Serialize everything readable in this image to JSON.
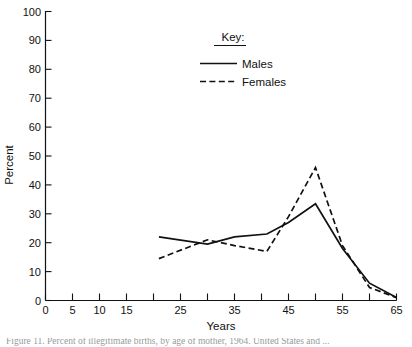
{
  "chart_data": {
    "type": "line",
    "title": "",
    "xlabel": "Years",
    "ylabel": "Percent",
    "xlim": [
      0,
      65
    ],
    "ylim": [
      0,
      100
    ],
    "grid": false,
    "legend_position": "top-center",
    "legend_title": "Key:",
    "x_ticks": [
      0,
      5,
      10,
      15,
      20,
      25,
      30,
      35,
      40,
      45,
      50,
      55,
      60,
      65
    ],
    "x_tick_labels": [
      "0",
      "5",
      "10",
      "15",
      "",
      "25",
      "",
      "35",
      "",
      "45",
      "",
      "55",
      "",
      "65"
    ],
    "y_ticks": [
      0,
      10,
      20,
      30,
      40,
      50,
      60,
      70,
      80,
      90,
      100
    ],
    "y_tick_labels": [
      "0",
      "10",
      "20",
      "30",
      "40",
      "50",
      "60",
      "70",
      "80",
      "90",
      "100"
    ],
    "series": [
      {
        "name": "Males",
        "style": "solid",
        "x": [
          21,
          30,
          35,
          41,
          45,
          50,
          55,
          60,
          65
        ],
        "values": [
          22,
          19.5,
          22,
          23,
          27,
          33.5,
          18,
          6,
          1
        ]
      },
      {
        "name": "Females",
        "style": "dashed",
        "x": [
          21,
          30,
          35,
          41,
          45,
          50,
          55,
          60,
          65
        ],
        "values": [
          14.5,
          21,
          19,
          17,
          29,
          46,
          19,
          4.5,
          1
        ]
      }
    ]
  },
  "axes": {
    "y_title": "Percent",
    "x_title": "Years"
  },
  "legend": {
    "title": "Key:",
    "entries": [
      {
        "label": "Males",
        "style": "solid"
      },
      {
        "label": "Females",
        "style": "dashed"
      }
    ]
  },
  "caption": {
    "text": "Figure 11. Percent of illegitimate births, by age of mother, 1964. United States and ..."
  }
}
